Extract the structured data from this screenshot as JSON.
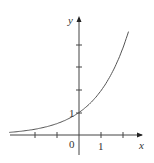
{
  "chart_data": {
    "type": "line",
    "title": "",
    "xlabel": "x",
    "ylabel": "y",
    "function": "y = 2^x",
    "xlim": [
      -3.3,
      2.6
    ],
    "ylim": [
      -0.7,
      5.4
    ],
    "x_ticks": [
      -3,
      -2,
      -1,
      1,
      2
    ],
    "y_ticks": [
      1,
      2,
      3,
      4
    ],
    "tick_labels": {
      "origin": "0",
      "x_one": "1",
      "y_one": "1"
    },
    "points": [
      [
        -3.3,
        0.1
      ],
      [
        -2,
        0.25
      ],
      [
        -1,
        0.5
      ],
      [
        0,
        1
      ],
      [
        1,
        2
      ],
      [
        2,
        4
      ],
      [
        2.2,
        4.6
      ]
    ]
  }
}
